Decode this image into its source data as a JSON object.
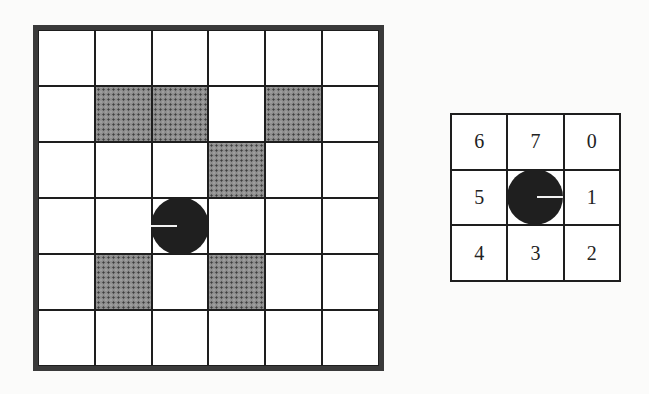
{
  "figure": {
    "left_grid": {
      "rows": 6,
      "cols": 6,
      "obstacles": [
        [
          1,
          1
        ],
        [
          1,
          2
        ],
        [
          1,
          4
        ],
        [
          2,
          3
        ],
        [
          4,
          1
        ],
        [
          4,
          3
        ]
      ],
      "robot": {
        "row": 3,
        "col": 2,
        "heading": "left"
      }
    },
    "right_grid": {
      "rows": 3,
      "cols": 3,
      "cells": [
        [
          "6",
          "7",
          "0"
        ],
        [
          "5",
          "",
          "1"
        ],
        [
          "4",
          "3",
          "2"
        ]
      ],
      "robot": {
        "row": 1,
        "col": 1,
        "heading": "right"
      }
    },
    "colors": {
      "grid_line": "#1e1e1e",
      "obstacle": "#8c8c8c",
      "robot": "#1f1f1f",
      "background": "#fbfbfa"
    }
  }
}
